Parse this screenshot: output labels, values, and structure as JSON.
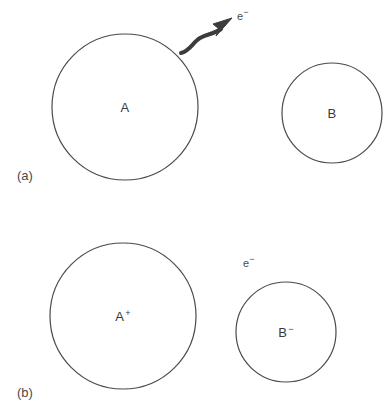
{
  "figure": {
    "background_color": "#ffffff",
    "stroke_color": "#4a4a4a",
    "arrow_color": "#3c3c3c",
    "text_color": "#3a3a3a",
    "width": 388,
    "height": 414
  },
  "panel_a": {
    "tag": "(a)",
    "atom_left": {
      "symbol": "A",
      "charge": "",
      "cx": 125,
      "cy": 107,
      "r": 73
    },
    "atom_right": {
      "symbol": "B",
      "charge": "",
      "cx": 332,
      "cy": 113,
      "r": 50
    },
    "electron": {
      "symbol": "e",
      "charge": "−"
    },
    "arrow": {
      "kind": "wavy-arrow",
      "from": [
        181,
        53
      ],
      "to": [
        229,
        21
      ]
    }
  },
  "panel_b": {
    "tag": "(b)",
    "atom_left": {
      "symbol": "A",
      "charge": "+",
      "cx": 123,
      "cy": 109,
      "r": 73
    },
    "atom_right": {
      "symbol": "B",
      "charge": "−",
      "cx": 286,
      "cy": 125,
      "r": 50
    },
    "electron": {
      "symbol": "e",
      "charge": "−"
    }
  }
}
